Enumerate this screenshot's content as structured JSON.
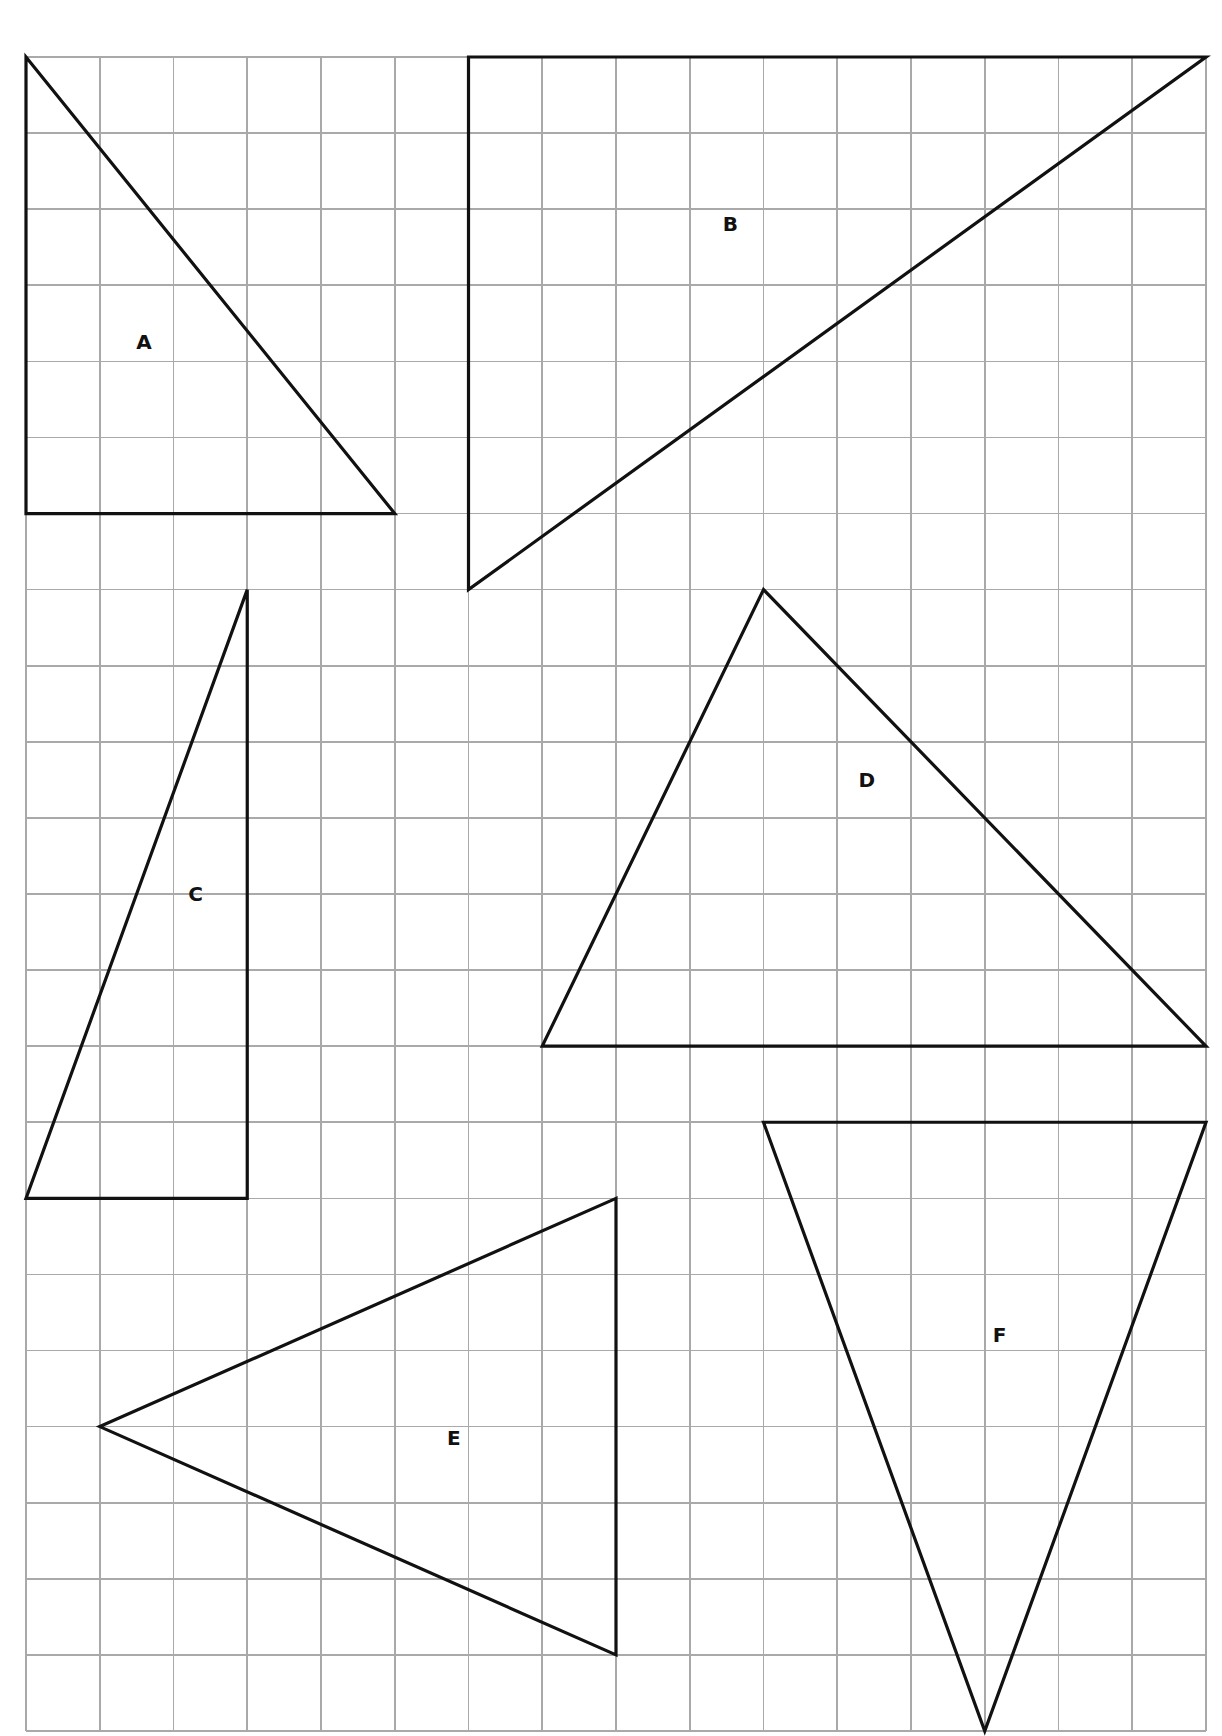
{
  "grid": {
    "origin_px": [
      26,
      57
    ],
    "cell_width_px": 73.75,
    "cell_height_px": 76.09,
    "columns": 16,
    "rows": 22,
    "line_color": "#a9a9a9"
  },
  "stroke_color": "#111111",
  "triangles": [
    {
      "label": "A",
      "vertices": [
        [
          0,
          0
        ],
        [
          0,
          6
        ],
        [
          5,
          6
        ]
      ],
      "label_pos": [
        1.6,
        3.75
      ]
    },
    {
      "label": "B",
      "vertices": [
        [
          6,
          0
        ],
        [
          16,
          0
        ],
        [
          6,
          7
        ]
      ],
      "label_pos": [
        9.55,
        2.2
      ]
    },
    {
      "label": "C",
      "vertices": [
        [
          3,
          7
        ],
        [
          3,
          15
        ],
        [
          0,
          15
        ]
      ],
      "label_pos": [
        2.3,
        11.0
      ]
    },
    {
      "label": "D",
      "vertices": [
        [
          10,
          7
        ],
        [
          7,
          13
        ],
        [
          16,
          13
        ]
      ],
      "label_pos": [
        11.4,
        9.5
      ]
    },
    {
      "label": "E",
      "vertices": [
        [
          8,
          15
        ],
        [
          1,
          18
        ],
        [
          8,
          21
        ]
      ],
      "label_pos": [
        5.8,
        18.15
      ]
    },
    {
      "label": "F",
      "vertices": [
        [
          10,
          14
        ],
        [
          16,
          14
        ],
        [
          13,
          22
        ]
      ],
      "label_pos": [
        13.2,
        16.8
      ]
    }
  ],
  "labels": {
    "a": "A",
    "b": "B",
    "c": "C",
    "d": "D",
    "e": "E",
    "f": "F"
  }
}
